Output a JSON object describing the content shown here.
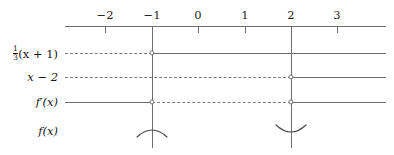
{
  "figure": {
    "type": "sign-chart",
    "background_color": "#ffffff",
    "line_color": "#6e6e6e",
    "text_color": "#141414"
  },
  "axis": {
    "name": "number-line",
    "y": 26,
    "x_start": 65,
    "x_end": 386,
    "ticks": [
      {
        "label": "−2",
        "value": -2,
        "x": 105,
        "full_height": false
      },
      {
        "label": "−1",
        "value": -1,
        "x": 152,
        "full_height": true
      },
      {
        "label": "0",
        "value": 0,
        "x": 198,
        "full_height": false
      },
      {
        "label": "1",
        "value": 1,
        "x": 245,
        "full_height": false
      },
      {
        "label": "2",
        "value": 2,
        "x": 291,
        "full_height": true
      },
      {
        "label": "3",
        "value": 3,
        "x": 337,
        "full_height": false
      }
    ],
    "critical_points": [
      -1,
      2
    ]
  },
  "rows": [
    {
      "id": "factor-one-third-x-plus-one",
      "label_html": "⅓(x + 1)",
      "label_parts": {
        "fraction_num": "1",
        "fraction_den": "3",
        "expr": "(x + 1)"
      },
      "y": 53,
      "segments": [
        {
          "from_x": 65,
          "to_x": 152,
          "style": "dashed",
          "sign": "negative"
        },
        {
          "from_x": 152,
          "to_x": 386,
          "style": "solid",
          "sign": "positive"
        }
      ],
      "zeros": [
        {
          "x": 152,
          "at": -1
        }
      ]
    },
    {
      "id": "factor-x-minus-two",
      "label_html": "x − 2",
      "y": 77,
      "segments": [
        {
          "from_x": 65,
          "to_x": 291,
          "style": "dashed",
          "sign": "negative"
        },
        {
          "from_x": 291,
          "to_x": 386,
          "style": "solid",
          "sign": "positive"
        }
      ],
      "zeros": [
        {
          "x": 291,
          "at": 2
        }
      ]
    },
    {
      "id": "derivative",
      "label_html": "f′(x)",
      "y": 102,
      "segments": [
        {
          "from_x": 65,
          "to_x": 152,
          "style": "solid",
          "sign": "positive"
        },
        {
          "from_x": 152,
          "to_x": 291,
          "style": "dashed",
          "sign": "negative"
        },
        {
          "from_x": 291,
          "to_x": 386,
          "style": "solid",
          "sign": "positive"
        }
      ],
      "zeros": [
        {
          "x": 152,
          "at": -1
        },
        {
          "x": 291,
          "at": 2
        }
      ]
    },
    {
      "id": "function",
      "label_html": "f(x)",
      "y": 131,
      "segments": [],
      "zeros": [],
      "arcs": [
        {
          "x": 152,
          "at": -1,
          "direction": "cap",
          "meaning": "local-maximum"
        },
        {
          "x": 291,
          "at": 2,
          "direction": "cup",
          "meaning": "local-minimum"
        }
      ]
    }
  ],
  "vertical_lines": [
    {
      "x": 152,
      "from_y": 26,
      "to_y": 148
    },
    {
      "x": 291,
      "from_y": 26,
      "to_y": 148
    }
  ]
}
